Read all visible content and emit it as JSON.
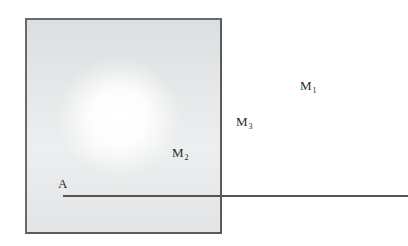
{
  "diagram": {
    "region": {
      "description": "shaded square region with bright center"
    },
    "labels": {
      "M1": {
        "base": "M",
        "sub": "1"
      },
      "M2": {
        "base": "M",
        "sub": "2"
      },
      "M3": {
        "base": "M",
        "sub": "3"
      },
      "A": {
        "text": "A"
      }
    },
    "colors": {
      "border": "#5a5a5a",
      "shading": "#e4e6e7",
      "center": "#ffffff",
      "line": "#555555",
      "text": "#2a2a2a"
    }
  }
}
